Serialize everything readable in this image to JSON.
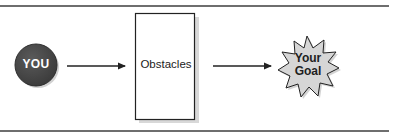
{
  "diagram": {
    "start": {
      "label": "YOU",
      "shape": "circle",
      "fill": "#4a4a4a",
      "text_color": "#ffffff"
    },
    "middle": {
      "label": "Obstacles",
      "shape": "rectangle",
      "fill": "#ffffff",
      "stroke": "#222222"
    },
    "end": {
      "label_line1": "Your",
      "label_line2": "Goal",
      "shape": "starburst",
      "fill": "#d6d6d6",
      "stroke": "#222222"
    },
    "connectors": [
      {
        "from": "start",
        "to": "middle",
        "type": "arrow"
      },
      {
        "from": "middle",
        "to": "end",
        "type": "arrow"
      }
    ]
  }
}
